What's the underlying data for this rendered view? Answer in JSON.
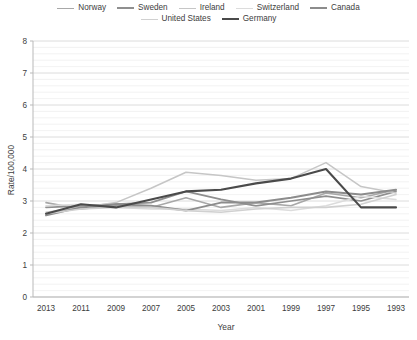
{
  "chart_data": {
    "type": "line",
    "title": "",
    "xlabel": "Year",
    "ylabel": "Rate/100,000",
    "categories": [
      "2013",
      "2011",
      "2009",
      "2007",
      "2005",
      "2003",
      "2001",
      "1999",
      "1997",
      "1995",
      "1993"
    ],
    "x": [
      2013,
      2011,
      2009,
      2007,
      2005,
      2003,
      2001,
      1999,
      1997,
      1995,
      1993
    ],
    "ylim": [
      0,
      8
    ],
    "yticks": [
      0,
      1,
      2,
      3,
      4,
      5,
      6,
      7,
      8
    ],
    "minor_tick_step": 0.2,
    "grid": true,
    "grid_axis": "y",
    "legend_position": "top",
    "series": [
      {
        "name": "Norway",
        "color": "#a8a8a8",
        "width": 1.6,
        "values": [
          2.95,
          2.75,
          2.85,
          2.8,
          3.1,
          2.8,
          2.95,
          2.85,
          3.25,
          3.1,
          3.35
        ]
      },
      {
        "name": "Sweden",
        "color": "#8f8f8f",
        "width": 1.7,
        "values": [
          2.8,
          2.85,
          2.9,
          2.95,
          3.3,
          3.05,
          2.85,
          3.0,
          3.15,
          3.0,
          3.3
        ]
      },
      {
        "name": "Ireland",
        "color": "#c6c6c6",
        "width": 1.5,
        "values": [
          2.65,
          2.8,
          2.95,
          3.4,
          3.9,
          3.8,
          3.65,
          3.7,
          4.2,
          3.45,
          3.25
        ]
      },
      {
        "name": "Switzerland",
        "color": "#dcdcdc",
        "width": 1.5,
        "values": [
          2.85,
          2.9,
          2.8,
          2.75,
          2.75,
          2.7,
          2.8,
          2.7,
          2.85,
          3.15,
          3.05
        ]
      },
      {
        "name": "Canada",
        "color": "#8c8c8c",
        "width": 2.0,
        "values": [
          2.55,
          2.8,
          2.9,
          2.85,
          2.7,
          2.95,
          2.95,
          3.1,
          3.3,
          3.2,
          3.35
        ]
      },
      {
        "name": "United States",
        "color": "#d0d0d0",
        "width": 1.6,
        "values": [
          2.6,
          2.75,
          2.8,
          2.8,
          2.7,
          2.65,
          2.75,
          2.8,
          2.8,
          2.9,
          3.2
        ]
      },
      {
        "name": "Germany",
        "color": "#4a4a4a",
        "width": 2.1,
        "values": [
          2.6,
          2.9,
          2.8,
          3.05,
          3.3,
          3.35,
          3.55,
          3.7,
          4.0,
          2.8,
          2.8
        ]
      }
    ]
  },
  "legend": {
    "rows": [
      [
        {
          "label": "Norway",
          "color": "#a8a8a8",
          "width": 1.6
        },
        {
          "label": "Sweden",
          "color": "#8f8f8f",
          "width": 2.0
        },
        {
          "label": "Ireland",
          "color": "#c6c6c6",
          "width": 1.5
        },
        {
          "label": "Switzerland",
          "color": "#dcdcdc",
          "width": 1.5
        },
        {
          "label": "Canada",
          "color": "#8c8c8c",
          "width": 2.2
        }
      ],
      [
        {
          "label": "United States",
          "color": "#d0d0d0",
          "width": 1.6
        },
        {
          "label": "Germany",
          "color": "#4a4a4a",
          "width": 2.4
        }
      ]
    ]
  },
  "axes": {
    "y_title": "Rate/100,000",
    "x_title": "Year",
    "y_tick_labels": [
      "8",
      "7",
      "6",
      "5",
      "4",
      "3",
      "2",
      "1",
      "0"
    ],
    "x_tick_labels": [
      "2013",
      "2011",
      "2009",
      "2007",
      "2005",
      "2003",
      "2001",
      "1999",
      "1997",
      "1995",
      "1993"
    ]
  }
}
